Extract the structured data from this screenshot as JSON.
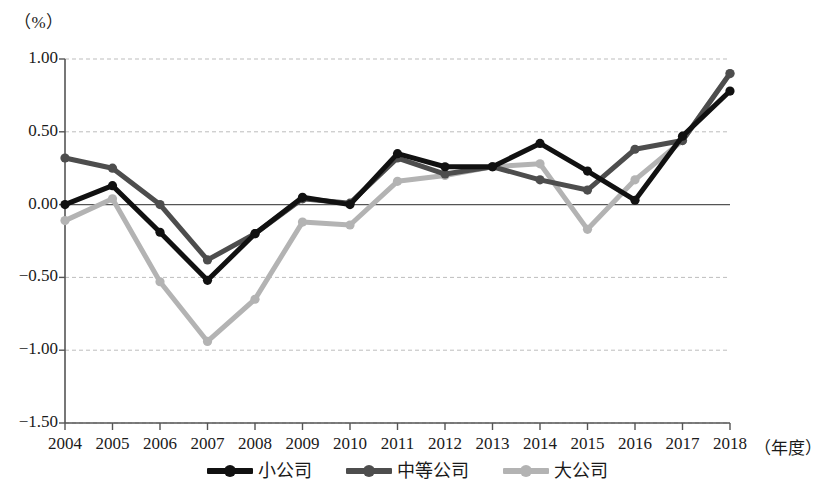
{
  "chart_data": {
    "type": "line",
    "title": "",
    "unit_label": "（%）",
    "xlabel": "（年度）",
    "ylabel": "",
    "categories": [
      "2004",
      "2005",
      "2006",
      "2007",
      "2008",
      "2009",
      "2010",
      "2011",
      "2012",
      "2013",
      "2014",
      "2015",
      "2016",
      "2017",
      "2018"
    ],
    "ylim": [
      -1.5,
      1.0
    ],
    "ytick_labels": [
      "1.00",
      "0.50",
      "0.00",
      "-0.50",
      "-1.00",
      "-1.50"
    ],
    "yticks": [
      1.0,
      0.5,
      0.0,
      -0.5,
      -1.0,
      -1.5
    ],
    "grid": "horizontal-dashed",
    "legend_position": "bottom-center",
    "series": [
      {
        "name": "小公司",
        "color": "#111111",
        "values": [
          0.0,
          0.13,
          -0.19,
          -0.52,
          -0.2,
          0.05,
          0.0,
          0.35,
          0.26,
          0.26,
          0.42,
          0.23,
          0.03,
          0.47,
          0.78
        ]
      },
      {
        "name": "中等公司",
        "color": "#4d4d4d",
        "values": [
          0.32,
          0.25,
          0.0,
          -0.38,
          -0.2,
          0.04,
          0.01,
          0.32,
          0.21,
          0.26,
          0.17,
          0.1,
          0.38,
          0.44,
          0.9
        ]
      },
      {
        "name": "大公司",
        "color": "#b3b3b3",
        "values": [
          -0.11,
          0.04,
          -0.53,
          -0.94,
          -0.65,
          -0.12,
          -0.14,
          0.16,
          0.2,
          0.26,
          0.28,
          -0.17,
          0.17,
          0.44,
          0.9
        ]
      }
    ]
  },
  "legend": {
    "items": [
      {
        "label": "小公司"
      },
      {
        "label": "中等公司"
      },
      {
        "label": "大公司"
      }
    ]
  },
  "axis": {
    "unit": "（%）",
    "x_axis_name": "（年度）"
  }
}
